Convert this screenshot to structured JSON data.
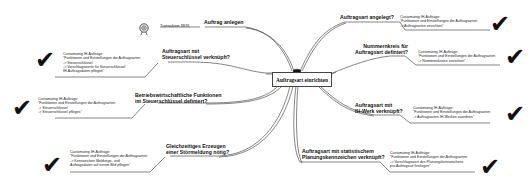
{
  "center": {
    "label": "Auftragsart einrichten"
  },
  "transaction": {
    "label": "Transaktion IW31",
    "icon": "target-icon"
  },
  "branches": [
    {
      "id": "auftrag-anlegen",
      "label_lines": [
        "Auftrag anlegen"
      ]
    },
    {
      "id": "steuerschluessel",
      "label_lines": [
        "Auftragsart mit",
        "Steuerschlüssel verknüpft?"
      ],
      "note": [
        "Customizing IH-Aufträge:",
        "\"Funktionen und Einstellungen der Auftragsarten",
        "-> Steuerschlüssel",
        "-> Vorschlagswerte für Steuerschlüssel",
        "   IH-Auftragsdaten pflegen\""
      ]
    },
    {
      "id": "betriebswirtschaftliche",
      "label_lines": [
        "Betriebswirtschaftliche Funktionen",
        "im Steuerschlüssel definiert?"
      ],
      "note": [
        "Customizing IH-Aufträge:",
        "\"Funktionen und Einstellungen der Auftragsarten",
        "-> Steuerschlüssel",
        "-> Steuerschlüssel pflegen\""
      ]
    },
    {
      "id": "stoermeldung",
      "label_lines": [
        "Gleichzeitiges Erzeugen",
        "einer Störmeldung nötig?"
      ],
      "note": [
        "Customizing IH-Aufträge:",
        "\"Funktionen und Einstellungen der Auftragsarten",
        "-> Kennzeichen Meldungs- und",
        "   Auftragsdaten auf einem Bild pflegen\""
      ]
    },
    {
      "id": "angelegt",
      "label_lines": [
        "Auftragsart angelegt?"
      ],
      "note": [
        "Customizing IH-Aufträge:",
        "\"Funktionen und Einstellungen der Auftragsarten",
        "-> Auftragsarten einrichten\""
      ]
    },
    {
      "id": "nummernkreis",
      "label_lines": [
        "Nummernkreis für",
        "Auftragsart definiert?"
      ],
      "note": [
        "Customizing IH-Aufträge:",
        "\"Funktionen und Einstellungen der Auftragsarten",
        "-> Nummernkreise einrichten\""
      ]
    },
    {
      "id": "ih-werk",
      "label_lines": [
        "Auftragsart mit",
        "IH-Werk verknüpft?"
      ],
      "note": [
        "Customizing IH-Aufträge:",
        "\"Funktionen und Einstellungen der Auftragsarten",
        "-> Auftragsarten IH-Werken zuordnen\""
      ]
    },
    {
      "id": "planungskennzeichen",
      "label_lines": [
        "Auftragsart mit statistischem",
        "Planungskennzeichen verknüpft?"
      ],
      "note": [
        "Customizing IH-Aufträge:",
        "\"Funktionen und Einstellungen der Auftragsarten",
        "-> Vorschlagswert des Planungskennzeichens",
        "   pro Auftragsart festlegen\""
      ]
    }
  ],
  "check_glyph": "✔"
}
